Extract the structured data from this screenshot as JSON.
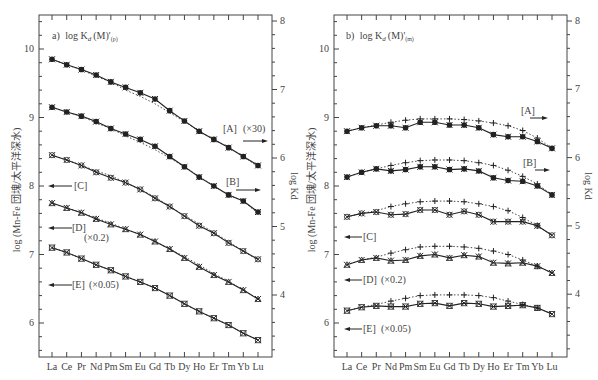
{
  "chart_data": [
    {
      "type": "line",
      "panel": "a",
      "title": "a) log Kd(M)'(p)",
      "title_parts": {
        "prefix": "a)",
        "main": "log K",
        "sub": "d",
        "arg": "(M)'",
        "subscript2": "(p)"
      },
      "ylabel": "log (Mn-Fe 団塊/太平洋深水)",
      "ylabel_right": "log Kd",
      "categories": [
        "La",
        "Ce",
        "Pr",
        "Nd",
        "Pm",
        "Sm",
        "Eu",
        "Gd",
        "Tb",
        "Dy",
        "Ho",
        "Er",
        "Tm",
        "Yb",
        "Lu"
      ],
      "ylim": [
        5.5,
        10.5
      ],
      "yticks": [
        6,
        7,
        8,
        9,
        10
      ],
      "ylim_right": [
        3.5,
        8.1
      ],
      "yticks_right": [
        4,
        5,
        6,
        7,
        8
      ],
      "series": [
        {
          "name": "[A] (×30)",
          "label": "[A]",
          "factor": "(×30)",
          "arrow": "right",
          "values": [
            9.85,
            9.77,
            9.7,
            9.62,
            9.52,
            9.44,
            9.36,
            9.27,
            9.1,
            8.95,
            8.8,
            8.68,
            8.56,
            8.43,
            8.3
          ],
          "dotted": [
            9.85,
            9.77,
            9.7,
            9.6,
            9.52,
            9.4,
            9.31,
            9.2,
            9.07,
            8.94,
            8.8,
            8.68,
            8.56,
            8.43,
            8.28
          ]
        },
        {
          "name": "[B]",
          "label": "[B]",
          "factor": "",
          "arrow": "right",
          "values": [
            9.15,
            9.08,
            9.02,
            8.94,
            8.84,
            8.76,
            8.68,
            8.58,
            8.43,
            8.28,
            8.13,
            8.0,
            7.87,
            7.78,
            7.62
          ],
          "dotted": [
            9.15,
            9.08,
            9.02,
            8.92,
            8.84,
            8.73,
            8.64,
            8.53,
            8.41,
            8.28,
            8.14,
            8.0,
            7.87,
            7.78,
            7.6
          ]
        },
        {
          "name": "[C]",
          "label": "[C]",
          "factor": "",
          "arrow": "left",
          "values": [
            8.45,
            8.38,
            8.3,
            8.2,
            8.12,
            8.05,
            7.95,
            7.82,
            7.7,
            7.56,
            7.42,
            7.31,
            7.17,
            7.05,
            6.93
          ],
          "dotted": [
            8.45,
            8.38,
            8.3,
            8.22,
            8.15,
            8.05,
            7.95,
            7.84,
            7.7,
            7.57,
            7.45,
            7.32,
            7.19,
            7.05,
            6.92
          ]
        },
        {
          "name": "[D] (×0.2)",
          "label": "[D]",
          "factor": "(×0.2)",
          "arrow": "left",
          "values": [
            7.75,
            7.68,
            7.61,
            7.52,
            7.44,
            7.37,
            7.29,
            7.19,
            7.08,
            6.95,
            6.82,
            6.7,
            6.6,
            6.48,
            6.35
          ],
          "dotted": [
            7.75,
            7.68,
            7.61,
            7.53,
            7.46,
            7.37,
            7.29,
            7.19,
            7.08,
            6.97,
            6.85,
            6.72,
            6.61,
            6.48,
            6.35
          ]
        },
        {
          "name": "[E] (×0.05)",
          "label": "[E]",
          "factor": "(×0.05)",
          "arrow": "left",
          "values": [
            7.1,
            7.03,
            6.94,
            6.85,
            6.77,
            6.68,
            6.6,
            6.51,
            6.4,
            6.28,
            6.17,
            6.07,
            5.97,
            5.85,
            5.75
          ],
          "dotted": [
            7.1,
            7.03,
            6.94,
            6.85,
            6.77,
            6.68,
            6.6,
            6.51,
            6.4,
            6.28,
            6.17,
            6.07,
            5.97,
            5.85,
            5.75
          ]
        }
      ]
    },
    {
      "type": "line",
      "panel": "b",
      "title": "b) log Kd(M)'(m)",
      "title_parts": {
        "prefix": "b)",
        "main": "log K",
        "sub": "d",
        "arg": "(M)'",
        "subscript2": "(m)"
      },
      "ylabel": "log (Mn-Fe 団塊/太平洋深水)",
      "ylabel_right": "log Kd",
      "categories": [
        "La",
        "Ce",
        "Pr",
        "Nd",
        "Pm",
        "Sm",
        "Eu",
        "Gd",
        "Tb",
        "Dy",
        "Ho",
        "Er",
        "Tm",
        "Yb",
        "Lu"
      ],
      "ylim": [
        5.5,
        10.5
      ],
      "yticks": [
        6,
        7,
        8,
        9,
        10
      ],
      "ylim_right": [
        3,
        8
      ],
      "yticks_right": [
        3,
        4,
        5,
        6,
        7,
        8
      ],
      "series": [
        {
          "name": "[A]",
          "label": "[A]",
          "factor": "",
          "arrow": "right",
          "values": [
            8.8,
            8.85,
            8.88,
            8.88,
            8.85,
            8.93,
            8.93,
            8.89,
            8.89,
            8.85,
            8.75,
            8.72,
            8.72,
            8.65,
            8.55
          ],
          "dotted": [
            8.8,
            8.85,
            8.89,
            8.93,
            8.96,
            8.98,
            8.98,
            8.98,
            8.97,
            8.95,
            8.92,
            8.88,
            8.81,
            8.7,
            8.55
          ]
        },
        {
          "name": "[B]",
          "label": "[B]",
          "factor": "",
          "arrow": "right",
          "values": [
            8.13,
            8.2,
            8.25,
            8.22,
            8.24,
            8.28,
            8.28,
            8.24,
            8.25,
            8.22,
            8.12,
            8.08,
            8.07,
            8.0,
            7.87
          ],
          "dotted": [
            8.13,
            8.2,
            8.25,
            8.3,
            8.34,
            8.37,
            8.38,
            8.38,
            8.37,
            8.34,
            8.3,
            8.23,
            8.14,
            8.03,
            7.87
          ]
        },
        {
          "name": "[C]",
          "label": "[C]",
          "factor": "",
          "arrow": "left",
          "values": [
            7.55,
            7.6,
            7.62,
            7.58,
            7.59,
            7.65,
            7.65,
            7.58,
            7.63,
            7.58,
            7.48,
            7.48,
            7.48,
            7.42,
            7.28
          ],
          "dotted": [
            7.55,
            7.6,
            7.64,
            7.7,
            7.74,
            7.77,
            7.78,
            7.78,
            7.77,
            7.74,
            7.7,
            7.64,
            7.54,
            7.42,
            7.28
          ]
        },
        {
          "name": "[D] (×0.2)",
          "label": "[D]",
          "factor": "(×0.2)",
          "arrow": "left",
          "values": [
            6.85,
            6.92,
            6.95,
            6.91,
            6.92,
            6.98,
            7.0,
            6.95,
            6.99,
            6.97,
            6.88,
            6.87,
            6.88,
            6.83,
            6.73
          ],
          "dotted": [
            6.85,
            6.92,
            6.96,
            7.02,
            7.07,
            7.11,
            7.12,
            7.12,
            7.11,
            7.09,
            7.05,
            7.0,
            6.92,
            6.83,
            6.73
          ]
        },
        {
          "name": "[E] (×0.05)",
          "label": "[E]",
          "factor": "(×0.05)",
          "arrow": "left",
          "values": [
            6.18,
            6.23,
            6.25,
            6.24,
            6.24,
            6.28,
            6.29,
            6.25,
            6.29,
            6.28,
            6.24,
            6.25,
            6.26,
            6.22,
            6.13
          ],
          "dotted": [
            6.18,
            6.23,
            6.27,
            6.32,
            6.36,
            6.4,
            6.41,
            6.41,
            6.41,
            6.4,
            6.37,
            6.32,
            6.27,
            6.22,
            6.13
          ]
        }
      ]
    }
  ],
  "panels": {
    "a": {
      "prefix": "a)",
      "title_main": "log K",
      "title_sub": "d",
      "title_arg": "(M)'",
      "title_sub2": "(p)",
      "ylabel": "log (Mn-Fe 団塊/太平洋深水)",
      "ylabel_right": "log Kd",
      "labels": {
        "A": "[A]",
        "A_factor": "(×30)",
        "B": "[B]",
        "C": "[C]",
        "D": "[D]",
        "D_factor": "(×0.2)",
        "E": "[E]",
        "E_factor": "(×0.05)"
      }
    },
    "b": {
      "prefix": "b)",
      "title_main": "log K",
      "title_sub": "d",
      "title_arg": "(M)'",
      "title_sub2": "(m)",
      "ylabel": "log (Mn-Fe 団塊/太平洋深水)",
      "ylabel_right": "log Kd",
      "labels": {
        "A": "[A]",
        "B": "[B]",
        "C": "[C]",
        "D": "[D]",
        "D_factor": "(×0.2)",
        "E": "[E]",
        "E_factor": "(×0.05)"
      }
    }
  }
}
